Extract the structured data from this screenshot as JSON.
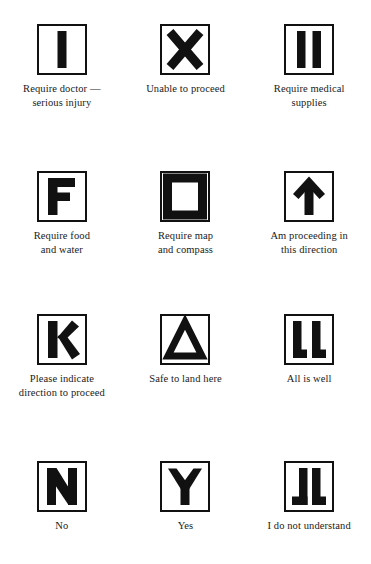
{
  "page": {
    "background_color": "#ffffff",
    "ink_color": "#111111"
  },
  "signals": [
    {
      "symbol_name": "letter-i-bar",
      "symbol_text": "I",
      "caption": "Require doctor —\nserious injury"
    },
    {
      "symbol_name": "cross-x",
      "symbol_text": "X",
      "caption": "Unable to proceed"
    },
    {
      "symbol_name": "double-bar-ii",
      "symbol_text": "II",
      "caption": "Require medical\nsupplies"
    },
    {
      "symbol_name": "letter-f",
      "symbol_text": "F",
      "caption": "Require food\nand water"
    },
    {
      "symbol_name": "hollow-square",
      "symbol_text": "□",
      "caption": "Require map\nand compass"
    },
    {
      "symbol_name": "up-arrow",
      "symbol_text": "↑",
      "caption": "Am proceeding in\nthis direction"
    },
    {
      "symbol_name": "letter-k",
      "symbol_text": "K",
      "caption": "Please indicate\ndirection to proceed"
    },
    {
      "symbol_name": "hollow-triangle",
      "symbol_text": "△",
      "caption": "Safe to land here"
    },
    {
      "symbol_name": "double-letter-ll",
      "symbol_text": "LL",
      "caption": "All is well"
    },
    {
      "symbol_name": "letter-n",
      "symbol_text": "N",
      "caption": "No"
    },
    {
      "symbol_name": "letter-y",
      "symbol_text": "Y",
      "caption": "Yes"
    },
    {
      "symbol_name": "letters-jl",
      "symbol_text": "JL",
      "caption": "I do not understand"
    }
  ]
}
